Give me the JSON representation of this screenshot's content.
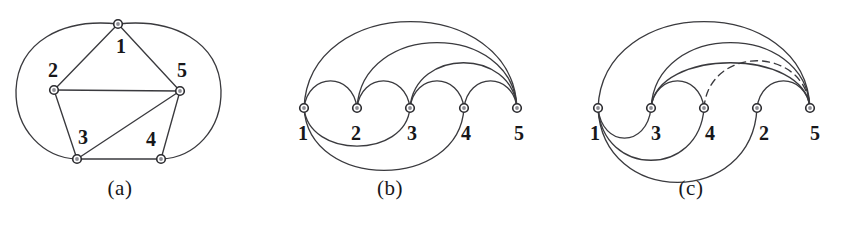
{
  "figure": {
    "kind": "graph-book-embedding-figure",
    "width": 842,
    "height": 232,
    "background": "#ffffff",
    "ink_color": "#3a3a3e",
    "label_color": "#17171a",
    "node_fill": "#ffffff",
    "node_core": "#8f8f96"
  },
  "panels": [
    {
      "id": "a",
      "caption": "(a)",
      "type": "plane-graph-drawing",
      "vertex_labels": [
        "1",
        "2",
        "5",
        "3",
        "4"
      ],
      "vertices": [
        {
          "label": "1",
          "x": 118,
          "y": 24,
          "label_x": 121,
          "label_y": 46
        },
        {
          "label": "2",
          "x": 54,
          "y": 90,
          "label_x": 53,
          "label_y": 70
        },
        {
          "label": "5",
          "x": 180,
          "y": 91,
          "label_x": 182,
          "label_y": 70
        },
        {
          "label": "3",
          "x": 77,
          "y": 159,
          "label_x": 83,
          "label_y": 137
        },
        {
          "label": "4",
          "x": 161,
          "y": 159,
          "label_x": 151,
          "label_y": 139
        }
      ],
      "edges": [
        {
          "from": "1",
          "to": "2",
          "style": "solid",
          "shape": "straight"
        },
        {
          "from": "1",
          "to": "5",
          "style": "solid",
          "shape": "straight"
        },
        {
          "from": "2",
          "to": "5",
          "style": "solid",
          "shape": "straight"
        },
        {
          "from": "2",
          "to": "3",
          "style": "solid",
          "shape": "straight"
        },
        {
          "from": "3",
          "to": "5",
          "style": "solid",
          "shape": "straight"
        },
        {
          "from": "3",
          "to": "4",
          "style": "solid",
          "shape": "straight"
        },
        {
          "from": "4",
          "to": "5",
          "style": "solid",
          "shape": "straight"
        },
        {
          "from": "1",
          "to": "3",
          "style": "solid",
          "shape": "outer-left-curve"
        },
        {
          "from": "1",
          "to": "4",
          "style": "solid",
          "shape": "outer-right-curve"
        }
      ]
    },
    {
      "id": "b",
      "caption": "(b)",
      "type": "arc-diagram",
      "spine_y": 108,
      "vertex_order": [
        "1",
        "2",
        "3",
        "4",
        "5"
      ],
      "vertices": [
        {
          "label": "1",
          "x": 64,
          "y": 108,
          "label_x": 63,
          "label_y": 133
        },
        {
          "label": "2",
          "x": 117,
          "y": 108,
          "label_x": 116,
          "label_y": 133
        },
        {
          "label": "3",
          "x": 170,
          "y": 108,
          "label_x": 172,
          "label_y": 133
        },
        {
          "label": "4",
          "x": 224,
          "y": 108,
          "label_x": 226,
          "label_y": 133
        },
        {
          "label": "5",
          "x": 277,
          "y": 108,
          "label_x": 279,
          "label_y": 133
        }
      ],
      "arcs_above": [
        {
          "from": "1",
          "to": "2",
          "style": "solid",
          "height": 27
        },
        {
          "from": "2",
          "to": "3",
          "style": "solid",
          "height": 27
        },
        {
          "from": "3",
          "to": "4",
          "style": "solid",
          "height": 27
        },
        {
          "from": "4",
          "to": "5",
          "style": "solid",
          "height": 27
        },
        {
          "from": "3",
          "to": "5",
          "style": "solid",
          "height": 45
        },
        {
          "from": "2",
          "to": "5",
          "style": "solid",
          "height": 65
        },
        {
          "from": "1",
          "to": "5",
          "style": "solid",
          "height": 86
        }
      ],
      "arcs_below": [
        {
          "from": "1",
          "to": "3",
          "style": "solid",
          "height": 38
        },
        {
          "from": "1",
          "to": "4",
          "style": "solid",
          "height": 62
        }
      ]
    },
    {
      "id": "c",
      "caption": "(c)",
      "type": "arc-diagram",
      "spine_y": 108,
      "vertex_order": [
        "1",
        "3",
        "4",
        "2",
        "5"
      ],
      "vertices": [
        {
          "label": "1",
          "x": 58,
          "y": 108,
          "label_x": 55,
          "label_y": 133
        },
        {
          "label": "3",
          "x": 111,
          "y": 108,
          "label_x": 116,
          "label_y": 133
        },
        {
          "label": "4",
          "x": 164,
          "y": 108,
          "label_x": 170,
          "label_y": 133
        },
        {
          "label": "2",
          "x": 217,
          "y": 108,
          "label_x": 224,
          "label_y": 133
        },
        {
          "label": "5",
          "x": 270,
          "y": 108,
          "label_x": 275,
          "label_y": 133
        }
      ],
      "arcs_above": [
        {
          "from": "3",
          "to": "4",
          "style": "solid",
          "height": 27
        },
        {
          "from": "2",
          "to": "5",
          "style": "solid",
          "height": 27
        },
        {
          "from": "3",
          "to": "5",
          "style": "solid",
          "height": 45
        },
        {
          "from": "4",
          "to": "5",
          "style": "dashed",
          "height": 47
        },
        {
          "from": "3",
          "to": "5",
          "style": "solid",
          "height": 65,
          "variant": "outer"
        },
        {
          "from": "1",
          "to": "5",
          "style": "solid",
          "height": 86
        }
      ],
      "arcs_below": [
        {
          "from": "1",
          "to": "3",
          "style": "solid",
          "height": 30
        },
        {
          "from": "1",
          "to": "4",
          "style": "solid",
          "height": 52
        },
        {
          "from": "1",
          "to": "2",
          "style": "solid",
          "height": 74
        }
      ]
    }
  ]
}
